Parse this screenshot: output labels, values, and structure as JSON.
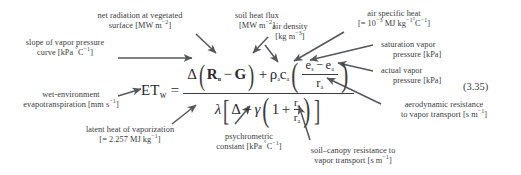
{
  "figure": {
    "equation_number": "(3.35)",
    "equation": {
      "lhs_symbol": "ET",
      "lhs_subscript": "w",
      "equals": "=",
      "numerator": {
        "delta": "Δ",
        "open_paren": "(",
        "rn": "R",
        "rn_sub": "n",
        "minus": "−",
        "g": "G",
        "close_paren": ")",
        "plus": "+",
        "rho": "ρ",
        "rho_sub": "a",
        "c": "c",
        "c_sub": "a",
        "inner_num_es": "e",
        "inner_num_es_sub": "s",
        "inner_minus": "−",
        "inner_num_ea": "e",
        "inner_num_ea_sub": "a",
        "inner_den_r": "r",
        "inner_den_r_sub": "a"
      },
      "denominator": {
        "lambda": "λ",
        "delta": "Δ",
        "plus": "+",
        "gamma": "γ",
        "one": "1",
        "plus2": "+",
        "rs": "r",
        "rs_sub": "s",
        "ra": "r",
        "ra_sub": "a"
      }
    },
    "callouts": [
      {
        "id": "net-radiation",
        "lines": [
          "net radiation at vegetated",
          "surface [MW m−2]"
        ],
        "line1": "net radiation at vegetated",
        "line2_text": "surface [MW m",
        "line2_sup": "−2",
        "line2_tail": "]"
      },
      {
        "id": "soil-heat-flux",
        "line1": "soil heat flux",
        "line2_text": "[MW m",
        "line2_sup": "−2",
        "line2_tail": "]"
      },
      {
        "id": "air-density",
        "line1": "air density",
        "line2_text": "[kg m",
        "line2_sup": "−3",
        "line2_tail": "]"
      },
      {
        "id": "air-specific-heat",
        "line1": "air specific heat",
        "line2_prefix": "[= 10",
        "line2_sup1": "−3",
        "line2_mid": " MJ kg",
        "line2_sup2": "−1",
        "line2_deg": "°",
        "line2_c": "C",
        "line2_sup3": "−1",
        "line2_tail": "]"
      },
      {
        "id": "saturation-vapor-pressure",
        "line1": "saturation vapor",
        "line2": "pressure [kPa]"
      },
      {
        "id": "actual-vapor-pressure",
        "line1": "actual vapor",
        "line2": "pressure [kPa]"
      },
      {
        "id": "aerodynamic-resistance",
        "line1": "aerodynamic resistance",
        "line2_text": "to vapor transport [s m",
        "line2_sup": "−1",
        "line2_tail": "]"
      },
      {
        "id": "slope-vapor-pressure-curve",
        "line1": "slope of vapor pressure",
        "line2_text": "curve [kPa ",
        "line2_deg": "°",
        "line2_c": "C",
        "line2_sup": "−1",
        "line2_tail": "]"
      },
      {
        "id": "wet-environment-evapotranspiration",
        "line1": "wet-environment",
        "line2_text": "evapotranspiration [mm s",
        "line2_sup": "−1",
        "line2_tail": "]"
      },
      {
        "id": "latent-heat-of-vaporization",
        "line1": "latent heat of vaporization",
        "line2_text": "[= 2.257 MJ kg",
        "line2_sup": "−1",
        "line2_tail": "]"
      },
      {
        "id": "psychrometric-constant",
        "line1": "psychrometric",
        "line2_text": "constant [kPa ",
        "line2_deg": "°",
        "line2_c": "C",
        "line2_sup": "−1",
        "line2_tail": "]"
      },
      {
        "id": "soil-canopy-resistance",
        "line1": "soil–canopy resistance to",
        "line2_text": "vapor transport [s m",
        "line2_sup": "−1",
        "line2_tail": "]"
      }
    ],
    "colors": {
      "text": "#3a3b3d",
      "equation": "#2b2c2e",
      "arrow": "#55575a",
      "background": "#ffffff"
    }
  }
}
